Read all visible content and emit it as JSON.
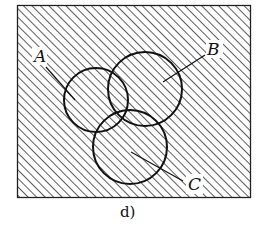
{
  "figure": {
    "caption": "d)",
    "type": "venn-diagram",
    "shaded_region": "complement of A∩B∩C",
    "unshaded_region": "A∩B∩C"
  },
  "sets": [
    {
      "name": "A",
      "label": "A"
    },
    {
      "name": "B",
      "label": "B"
    },
    {
      "name": "C",
      "label": "C"
    }
  ],
  "colors": {
    "stroke": "#111111",
    "hatch": "#333333",
    "background": "#ffffff"
  }
}
